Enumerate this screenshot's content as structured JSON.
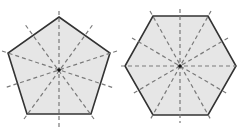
{
  "diagram": {
    "title": "",
    "colors": {
      "fill": "#e6e6e6",
      "outline": "#333333",
      "symmetry_line": "#7a7a7a",
      "center_dot": "#111111",
      "background": "#ffffff"
    },
    "shapes": [
      {
        "name": "regular-pentagon",
        "sides": 5,
        "lines_of_symmetry": 5,
        "center": [
          59,
          70
        ],
        "vertices": [
          [
            59,
            17
          ],
          [
            110,
            53
          ],
          [
            91,
            114
          ],
          [
            27,
            114
          ],
          [
            8,
            53
          ]
        ]
      },
      {
        "name": "regular-hexagon",
        "sides": 6,
        "lines_of_symmetry": 6,
        "center": [
          180,
          66
        ],
        "vertices": [
          [
            153,
            16
          ],
          [
            208,
            16
          ],
          [
            236,
            66
          ],
          [
            208,
            115
          ],
          [
            153,
            115
          ],
          [
            125,
            66
          ]
        ]
      }
    ]
  }
}
